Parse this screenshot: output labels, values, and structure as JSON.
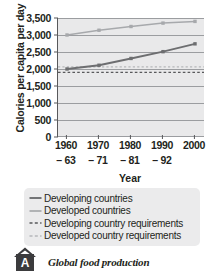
{
  "chart_data": {
    "type": "line",
    "title": "",
    "xlabel": "Year",
    "ylabel": "Calories per capita per day",
    "categories": [
      "1960–63",
      "1970–71",
      "1980–81",
      "1990–92",
      "2000"
    ],
    "x_tick_years": [
      "1960",
      "1970",
      "1980",
      "1990",
      "2000"
    ],
    "x_tick_subs": [
      "– 63",
      "– 71",
      "– 81",
      "– 92",
      ""
    ],
    "ylim": [
      0,
      3500
    ],
    "ytick_values": [
      3500,
      3000,
      2500,
      2000,
      1500,
      1000,
      500,
      0
    ],
    "ytick_labels": [
      "3,500",
      "3,000",
      "2,500",
      "2,000",
      "1,500",
      "1,000",
      "500",
      "0"
    ],
    "grid": true,
    "legend_position": "below",
    "series": [
      {
        "name": "Developing countries",
        "style": "solid",
        "color": "#6d6e70",
        "marker": "square",
        "values": [
          2000,
          2110,
          2310,
          2510,
          2740
        ]
      },
      {
        "name": "Developed countries",
        "style": "solid",
        "color": "#a7a9ac",
        "marker": "square",
        "values": [
          3000,
          3140,
          3250,
          3350,
          3400
        ]
      },
      {
        "name": "Developing country requirements",
        "style": "dashed",
        "color": "#58595b",
        "marker": "none",
        "constant": 1900
      },
      {
        "name": "Developed country requirements",
        "style": "dashed",
        "color": "#b6b8ba",
        "marker": "none",
        "constant": 2060
      }
    ]
  },
  "legend": {
    "items": [
      {
        "label": "Developing countries"
      },
      {
        "label": "Developed countries"
      },
      {
        "label": "Developing country requirements"
      },
      {
        "label": "Developed country requirements"
      }
    ]
  },
  "caption": {
    "badge": "A",
    "text": "Global food production"
  },
  "colors": {
    "developing": "#6d6e70",
    "developed": "#a7a9ac",
    "developing_req": "#58595b",
    "developed_req": "#b6b8ba",
    "plot_bg": "#e9e9ea",
    "gridline": "#9b9da0",
    "axis": "#58595b",
    "legend_bg": "#ebebec",
    "badge_bg": "#3b3b3d",
    "text": "#231f20"
  }
}
